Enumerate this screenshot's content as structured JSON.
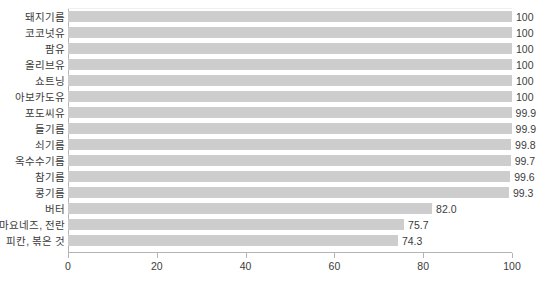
{
  "chart_data": {
    "type": "bar",
    "orientation": "horizontal",
    "title": "",
    "subtitle": "",
    "xlabel": "",
    "ylabel": "",
    "xlim": [
      0,
      100
    ],
    "xticks": [
      0,
      20,
      40,
      60,
      80,
      100
    ],
    "xtick_labels": [
      "0",
      "20",
      "40",
      "60",
      "80",
      "100"
    ],
    "grid": false,
    "legend": "none",
    "bar_color": "#cdcdcd",
    "axis_color": "#b4b4b4",
    "text_color": "#3b3b3b",
    "categories": [
      "돼지기름",
      "코코넛유",
      "팜유",
      "올리브유",
      "쇼트닝",
      "아보카도유",
      "포도씨유",
      "들기름",
      "쇠기름",
      "옥수수기름",
      "참기름",
      "콩기름",
      "버터",
      "마요네즈, 전란",
      "피칸, 볶은 것"
    ],
    "values": [
      100,
      100,
      100,
      100,
      100,
      100,
      99.9,
      99.9,
      99.8,
      99.7,
      99.6,
      99.3,
      82.0,
      75.7,
      74.3
    ],
    "value_labels": [
      "100",
      "100",
      "100",
      "100",
      "100",
      "100",
      "99.9",
      "99.9",
      "99.8",
      "99.7",
      "99.6",
      "99.3",
      "82.0",
      "75.7",
      "74.3"
    ]
  }
}
